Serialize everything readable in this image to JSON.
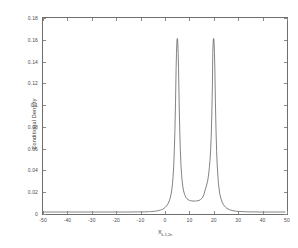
{
  "chart_data": {
    "type": "line",
    "title": "",
    "xlabel": "X_{k-1,2n}",
    "xlabel_base": "X",
    "xlabel_sub": "k-1,2n",
    "ylabel": "Conditional Density",
    "xlim": [
      -50,
      50
    ],
    "ylim": [
      0,
      0.18
    ],
    "grid": false,
    "legend": null,
    "line_color": "#4d4d4d",
    "line_width": 0.7,
    "background_color": "#ffffff",
    "axis_color": "#6e6e6e",
    "xticks": [
      -50,
      -40,
      -30,
      -20,
      -10,
      0,
      10,
      20,
      30,
      40,
      50
    ],
    "xtick_labels": [
      "-50",
      "-40",
      "-30",
      "-20",
      "-10",
      "0",
      "10",
      "20",
      "30",
      "40",
      "50"
    ],
    "yticks": [
      0,
      0.02,
      0.04,
      0.06,
      0.08,
      0.1,
      0.12,
      0.14,
      0.16,
      0.18
    ],
    "ytick_labels": [
      "0",
      "0.02",
      "0.04",
      "0.06",
      "0.08",
      "0.1",
      "0.12",
      "0.14",
      "0.16",
      "0.18"
    ],
    "peaks": [
      {
        "x": 5.5,
        "y": 0.161
      },
      {
        "x": 20.5,
        "y": 0.161
      }
    ],
    "valley": {
      "x": 13.0,
      "y": 0.0102
    },
    "series": [
      {
        "name": "conditional density",
        "x": [
          -50,
          -45,
          -40,
          -35,
          -30,
          -28,
          -26,
          -24,
          -22,
          -20,
          -18,
          -16,
          -14,
          -12,
          -11,
          -10,
          -9,
          -8,
          -7,
          -6.5,
          -6,
          -5.5,
          -5,
          -4.5,
          -4,
          -3.5,
          -3,
          -2.5,
          -2,
          -1.5,
          -1,
          -0.5,
          0,
          0.5,
          1,
          1.5,
          2,
          2.5,
          3,
          3.25,
          3.5,
          3.75,
          4,
          4.25,
          4.5,
          4.75,
          5,
          5.15,
          5.3,
          5.4,
          5.5,
          5.6,
          5.7,
          5.85,
          6,
          6.25,
          6.5,
          6.75,
          7,
          7.25,
          7.5,
          7.75,
          8,
          8.5,
          9,
          9.5,
          10,
          10.5,
          11,
          11.5,
          12,
          12.5,
          13,
          13.5,
          14,
          14.5,
          15,
          15.5,
          16,
          16.5,
          17,
          17.5,
          18,
          18.25,
          18.5,
          18.75,
          19,
          19.25,
          19.5,
          19.75,
          20,
          20.15,
          20.3,
          20.4,
          20.5,
          20.6,
          20.7,
          20.85,
          21,
          21.25,
          21.5,
          21.75,
          22,
          22.5,
          23,
          23.5,
          24,
          24.5,
          25,
          25.5,
          26,
          27,
          28,
          29,
          30,
          32,
          34,
          36,
          38,
          40,
          45,
          50
        ],
        "y": [
          0.0,
          0.0,
          0.0,
          0.0,
          0.0,
          0.0,
          0.0,
          0.0,
          0.0,
          0.0,
          0.0,
          0.0,
          0.0,
          0.0001,
          0.0001,
          0.0001,
          0.0001,
          0.0002,
          0.0002,
          0.0003,
          0.0003,
          0.0004,
          0.0005,
          0.0006,
          0.0007,
          0.0008,
          0.001,
          0.0012,
          0.0015,
          0.0018,
          0.0022,
          0.0027,
          0.0034,
          0.0043,
          0.0055,
          0.0071,
          0.0093,
          0.0125,
          0.0175,
          0.0212,
          0.0262,
          0.033,
          0.0425,
          0.056,
          0.075,
          0.101,
          0.133,
          0.147,
          0.157,
          0.16,
          0.161,
          0.16,
          0.157,
          0.148,
          0.134,
          0.102,
          0.076,
          0.057,
          0.044,
          0.035,
          0.0285,
          0.024,
          0.0205,
          0.0163,
          0.0138,
          0.0123,
          0.0114,
          0.0108,
          0.0105,
          0.0103,
          0.0102,
          0.0102,
          0.0102,
          0.0103,
          0.0105,
          0.0108,
          0.0114,
          0.0123,
          0.0138,
          0.0163,
          0.0205,
          0.024,
          0.0285,
          0.032,
          0.036,
          0.0415,
          0.048,
          0.057,
          0.07,
          0.09,
          0.118,
          0.147,
          0.157,
          0.16,
          0.161,
          0.16,
          0.157,
          0.148,
          0.134,
          0.101,
          0.075,
          0.056,
          0.0425,
          0.0262,
          0.0175,
          0.0125,
          0.0093,
          0.0071,
          0.0055,
          0.0043,
          0.0034,
          0.0022,
          0.0015,
          0.001,
          0.0007,
          0.0004,
          0.0002,
          0.0001,
          0.0001,
          0.0,
          0.0,
          0.0
        ]
      }
    ]
  }
}
